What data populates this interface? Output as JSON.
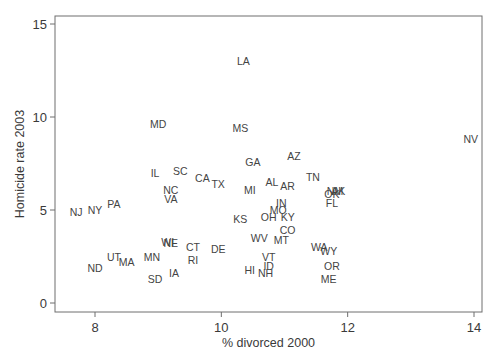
{
  "chart_data": {
    "type": "scatter",
    "title": "",
    "xlabel": "% divorced 2000",
    "ylabel": "Homicide rate 2003",
    "xlim": [
      7.5,
      14.1
    ],
    "ylim": [
      -0.5,
      15.5
    ],
    "xticks": [
      8,
      10,
      12,
      14
    ],
    "yticks": [
      0,
      5,
      10,
      15
    ],
    "grid": false,
    "legend": null,
    "marker": "state-abbreviation-label",
    "points": [
      {
        "label": "LA",
        "x": 10.35,
        "y": 13.0
      },
      {
        "label": "NV",
        "x": 13.95,
        "y": 8.8
      },
      {
        "label": "MD",
        "x": 9.0,
        "y": 9.6
      },
      {
        "label": "MS",
        "x": 10.3,
        "y": 9.4
      },
      {
        "label": "GA",
        "x": 10.5,
        "y": 7.6
      },
      {
        "label": "AZ",
        "x": 11.15,
        "y": 7.9
      },
      {
        "label": "IL",
        "x": 8.95,
        "y": 7.0
      },
      {
        "label": "SC",
        "x": 9.35,
        "y": 7.1
      },
      {
        "label": "CA",
        "x": 9.7,
        "y": 6.7
      },
      {
        "label": "TX",
        "x": 9.95,
        "y": 6.4
      },
      {
        "label": "MI",
        "x": 10.45,
        "y": 6.1
      },
      {
        "label": "AL",
        "x": 10.8,
        "y": 6.5
      },
      {
        "label": "AR",
        "x": 11.05,
        "y": 6.3
      },
      {
        "label": "TN",
        "x": 11.45,
        "y": 6.8
      },
      {
        "label": "NM",
        "x": 11.8,
        "y": 6.0
      },
      {
        "label": "AK",
        "x": 11.85,
        "y": 6.0
      },
      {
        "label": "OK",
        "x": 11.75,
        "y": 5.85
      },
      {
        "label": "FL",
        "x": 11.75,
        "y": 5.4
      },
      {
        "label": "NC",
        "x": 9.2,
        "y": 6.1
      },
      {
        "label": "VA",
        "x": 9.2,
        "y": 5.6
      },
      {
        "label": "IN",
        "x": 10.95,
        "y": 5.4
      },
      {
        "label": "MO",
        "x": 10.9,
        "y": 5.0
      },
      {
        "label": "KY",
        "x": 11.05,
        "y": 4.6
      },
      {
        "label": "OH",
        "x": 10.75,
        "y": 4.6
      },
      {
        "label": "KS",
        "x": 10.3,
        "y": 4.5
      },
      {
        "label": "CO",
        "x": 11.05,
        "y": 3.9
      },
      {
        "label": "MT",
        "x": 10.95,
        "y": 3.4
      },
      {
        "label": "WV",
        "x": 10.6,
        "y": 3.5
      },
      {
        "label": "WA",
        "x": 11.55,
        "y": 3.0
      },
      {
        "label": "WY",
        "x": 11.7,
        "y": 2.8
      },
      {
        "label": "OR",
        "x": 11.75,
        "y": 2.0
      },
      {
        "label": "ME",
        "x": 11.7,
        "y": 1.3
      },
      {
        "label": "NJ",
        "x": 7.7,
        "y": 4.9
      },
      {
        "label": "NY",
        "x": 8.0,
        "y": 5.0
      },
      {
        "label": "PA",
        "x": 8.3,
        "y": 5.3
      },
      {
        "label": "UT",
        "x": 8.3,
        "y": 2.5
      },
      {
        "label": "MA",
        "x": 8.5,
        "y": 2.2
      },
      {
        "label": "ND",
        "x": 8.0,
        "y": 1.9
      },
      {
        "label": "MN",
        "x": 8.9,
        "y": 2.5
      },
      {
        "label": "SD",
        "x": 8.95,
        "y": 1.3
      },
      {
        "label": "IA",
        "x": 9.25,
        "y": 1.6
      },
      {
        "label": "WI",
        "x": 9.15,
        "y": 3.3
      },
      {
        "label": "NE",
        "x": 9.2,
        "y": 3.2
      },
      {
        "label": "CT",
        "x": 9.55,
        "y": 3.0
      },
      {
        "label": "RI",
        "x": 9.55,
        "y": 2.3
      },
      {
        "label": "DE",
        "x": 9.95,
        "y": 2.9
      },
      {
        "label": "VT",
        "x": 10.75,
        "y": 2.5
      },
      {
        "label": "ID",
        "x": 10.75,
        "y": 2.0
      },
      {
        "label": "HI",
        "x": 10.45,
        "y": 1.8
      },
      {
        "label": "NH",
        "x": 10.7,
        "y": 1.6
      }
    ]
  },
  "plot": {
    "px": {
      "left": 55,
      "right": 482,
      "top": 16,
      "bottom": 312
    },
    "x_map": {
      "v0": 8,
      "p0": 95,
      "v1": 14,
      "p1": 474
    },
    "y_map": {
      "v0": 0,
      "p0": 303,
      "v1": 15,
      "p1": 24
    }
  }
}
